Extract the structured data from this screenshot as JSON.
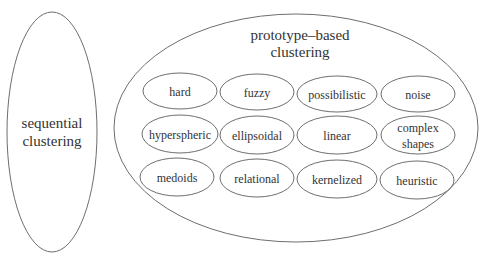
{
  "diagram": {
    "stroke_color": "#6e6e6e",
    "text_color": "#333333",
    "sequential": {
      "lines": [
        "sequential",
        "clustering"
      ]
    },
    "prototype": {
      "lines": [
        "prototype–based",
        "clustering"
      ],
      "items": [
        {
          "lines": [
            "hard"
          ]
        },
        {
          "lines": [
            "fuzzy"
          ]
        },
        {
          "lines": [
            "possibilistic"
          ]
        },
        {
          "lines": [
            "noise"
          ]
        },
        {
          "lines": [
            "hyperspheric"
          ]
        },
        {
          "lines": [
            "ellipsoidal"
          ]
        },
        {
          "lines": [
            "linear"
          ]
        },
        {
          "lines": [
            "complex",
            "shapes"
          ]
        },
        {
          "lines": [
            "medoids"
          ]
        },
        {
          "lines": [
            "relational"
          ]
        },
        {
          "lines": [
            "kernelized"
          ]
        },
        {
          "lines": [
            "heuristic"
          ]
        }
      ]
    }
  }
}
